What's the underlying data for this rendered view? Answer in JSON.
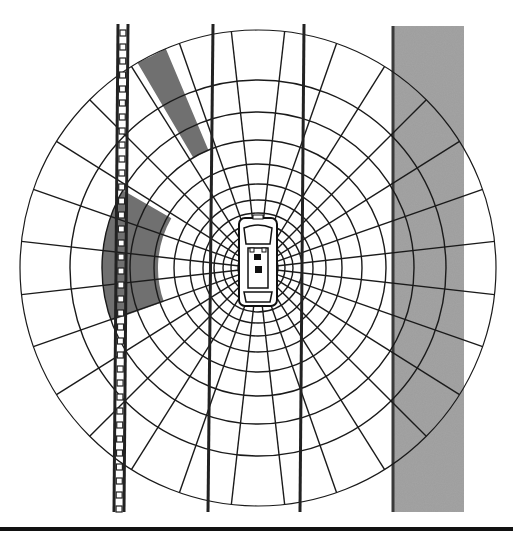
{
  "diagram": {
    "type": "polar occupancy grid around vehicle",
    "center": [
      258,
      268
    ],
    "outer_radius": 238,
    "rings": [
      14,
      20,
      27,
      35,
      44,
      55,
      68,
      84,
      104,
      128,
      156,
      188,
      238
    ],
    "spoke_count": 28,
    "colors": {
      "grid": "#1a1a1a",
      "occupied": "#707070",
      "wall": "#9a9a9a",
      "wall_edge": "#3a3a3a",
      "lane_line": "#222222"
    },
    "elements": {
      "car": "vehicle-top-view",
      "left_barrier": "ladder-guardrail",
      "lane_lines": 2,
      "right_wall": "concrete-wall",
      "occupied_regions": [
        "front-sector",
        "front-left-sector"
      ],
      "baseline": "bottom-rule"
    }
  }
}
